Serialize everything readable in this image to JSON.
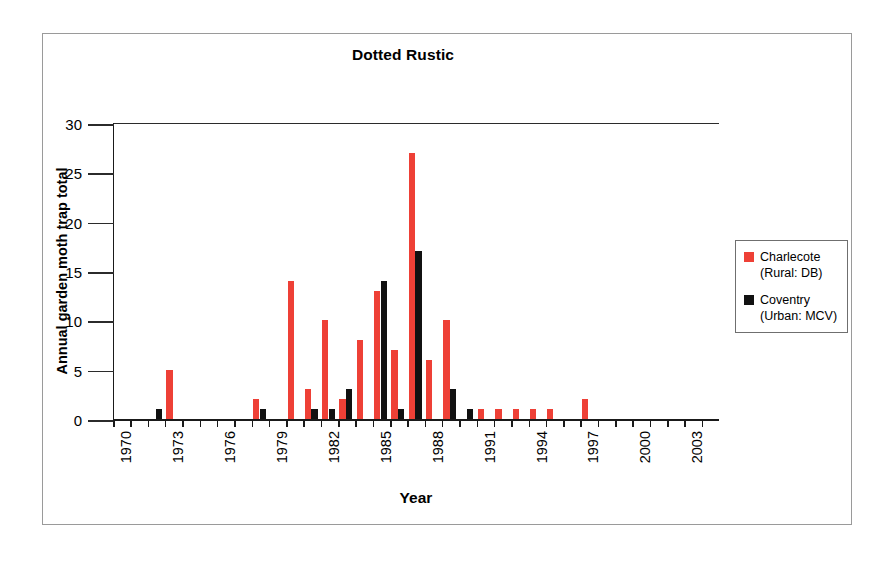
{
  "chart_data": {
    "type": "bar",
    "title": "Dotted Rustic",
    "xlabel": "Year",
    "ylabel": "Annual garden moth trap total",
    "ylim": [
      0,
      30
    ],
    "yticks": [
      0,
      5,
      10,
      15,
      20,
      25,
      30
    ],
    "xlim": [
      1970,
      2004
    ],
    "xtick_labels": [
      "1970",
      "1973",
      "1976",
      "1979",
      "1982",
      "1985",
      "1988",
      "1991",
      "1994",
      "1997",
      "2000",
      "2003"
    ],
    "xtick_step": 3,
    "grid": false,
    "legend_position": "right",
    "categories": [
      1970,
      1971,
      1972,
      1973,
      1974,
      1975,
      1976,
      1977,
      1978,
      1979,
      1980,
      1981,
      1982,
      1983,
      1984,
      1985,
      1986,
      1987,
      1988,
      1989,
      1990,
      1991,
      1992,
      1993,
      1994,
      1995,
      1996,
      1997,
      1998,
      1999,
      2000,
      2001,
      2002,
      2003,
      2004
    ],
    "series": [
      {
        "name": "Charlecote (Rural: DB)",
        "color": "#ee4036",
        "values": [
          0,
          0,
          0,
          5,
          0,
          0,
          0,
          0,
          2,
          0,
          14,
          3,
          10,
          2,
          8,
          13,
          7,
          27,
          6,
          10,
          0,
          1,
          1,
          1,
          1,
          1,
          0,
          2,
          0,
          0,
          0,
          0,
          0,
          0,
          0
        ]
      },
      {
        "name": "Coventry (Urban: MCV)",
        "color": "#111111",
        "values": [
          0,
          0,
          1,
          0,
          0,
          0,
          0,
          0,
          1,
          0,
          0,
          1,
          1,
          3,
          0,
          14,
          1,
          17,
          0,
          3,
          1,
          0,
          0,
          0,
          0,
          0,
          0,
          0,
          0,
          0,
          0,
          0,
          0,
          0,
          0
        ]
      }
    ]
  },
  "legend": {
    "entries": [
      {
        "label_line1": "Charlecote",
        "label_line2": "(Rural: DB)",
        "swatch": "red"
      },
      {
        "label_line1": "Coventry",
        "label_line2": "(Urban: MCV)",
        "swatch": "black"
      }
    ]
  }
}
